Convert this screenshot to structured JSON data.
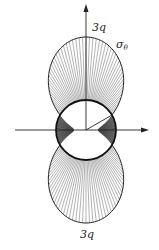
{
  "diagram": {
    "labels": {
      "top_value": "3q",
      "bottom_value": "3q",
      "stress_symbol": "σ",
      "stress_subscript": "θ"
    },
    "geometry": {
      "center": [
        86,
        130
      ],
      "hole_radius": 30,
      "lobe_peak_top_y": 37,
      "lobe_peak_bottom_y": 223
    },
    "colors": {
      "line": "#222222",
      "hatch": "#555555",
      "shade": "#444444",
      "background": "#ffffff"
    }
  }
}
